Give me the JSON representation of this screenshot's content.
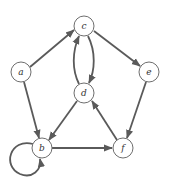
{
  "diagram": {
    "type": "directed-graph",
    "colors": {
      "node_stroke": "#6e6e6e",
      "edge": "#5a5a5a",
      "label": "#333333",
      "background": "#ffffff"
    },
    "nodes": [
      {
        "id": "a",
        "label": "a",
        "x": 21,
        "y": 72
      },
      {
        "id": "b",
        "label": "b",
        "x": 42,
        "y": 148
      },
      {
        "id": "c",
        "label": "c",
        "x": 84,
        "y": 26
      },
      {
        "id": "d",
        "label": "d",
        "x": 84,
        "y": 93
      },
      {
        "id": "e",
        "label": "e",
        "x": 149,
        "y": 72
      },
      {
        "id": "f",
        "label": "f",
        "x": 123,
        "y": 148
      }
    ],
    "edges": [
      {
        "from": "a",
        "to": "c"
      },
      {
        "from": "c",
        "to": "e"
      },
      {
        "from": "a",
        "to": "b"
      },
      {
        "from": "c",
        "to": "d",
        "curve": "right"
      },
      {
        "from": "d",
        "to": "c",
        "curve": "left"
      },
      {
        "from": "d",
        "to": "b"
      },
      {
        "from": "e",
        "to": "f"
      },
      {
        "from": "f",
        "to": "d"
      },
      {
        "from": "b",
        "to": "f"
      },
      {
        "from": "b",
        "to": "b",
        "self_loop": true
      }
    ]
  }
}
